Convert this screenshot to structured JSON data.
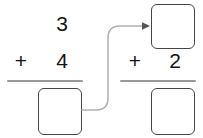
{
  "canvas": {
    "width": 203,
    "height": 138,
    "background": "#ffffff"
  },
  "style": {
    "digit_color": "#141414",
    "rule_color": "#9a9a9a",
    "box_border_color": "#454545",
    "connector_color": "#b0b0b0",
    "arrowhead_color": "#555555"
  },
  "worksheet": {
    "type": "two-step-vertical-addition",
    "problems": [
      {
        "id": "left",
        "addend_top": "3",
        "operator": "+",
        "addend_bottom": "4",
        "answer": "",
        "answer_placeholder": ""
      },
      {
        "id": "right",
        "addend_top": "",
        "addend_top_placeholder": "",
        "operator": "+",
        "addend_bottom": "2",
        "answer": "",
        "answer_placeholder": ""
      }
    ],
    "connector": {
      "label": "carry-result-arrow",
      "from": "left-answer-box",
      "to": "right-top-operand-box",
      "arrowhead": "right"
    }
  }
}
